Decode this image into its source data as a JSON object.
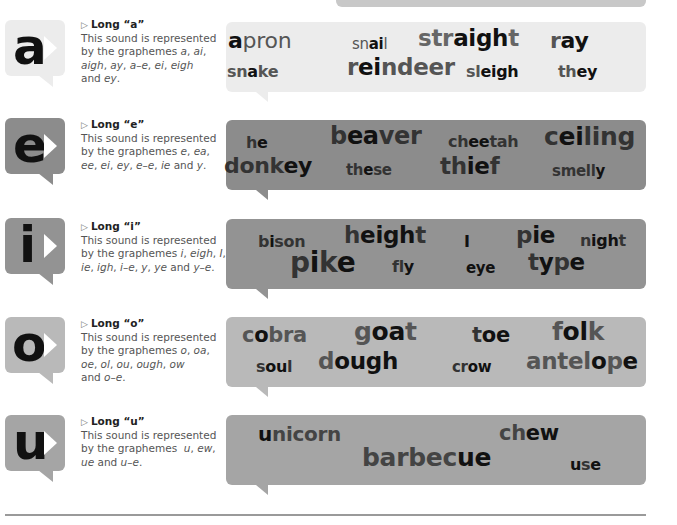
{
  "colors": {
    "a_bubble": "#ececec",
    "e_bubble": "#8c8c8c",
    "i_bubble": "#939393",
    "o_bubble": "#b9b9b9",
    "u_bubble": "#a5a5a5",
    "word_dim": "#555555",
    "word_strong": "#111111"
  },
  "sections": [
    {
      "letter": "a",
      "title": "Long “a”",
      "desc_line1": "This sound is represented",
      "desc_line2": "by the graphemes a, ai,",
      "desc_line3": "aigh, ay, a–e, ei, eigh",
      "desc_line4": "and ey.",
      "words": [
        "apron",
        "snail",
        "straight",
        "ray",
        "snake",
        "reindeer",
        "sleigh",
        "they"
      ]
    },
    {
      "letter": "e",
      "title": "Long “e”",
      "desc_line1": "This sound is represented",
      "desc_line2": "by the graphemes e, ea,",
      "desc_line3": "ee, ei, ey, e–e, ie and y.",
      "words": [
        "he",
        "beaver",
        "cheetah",
        "ceiling",
        "donkey",
        "these",
        "thief",
        "smelly"
      ]
    },
    {
      "letter": "i",
      "title": "Long “i”",
      "desc_line1": "This sound is represented",
      "desc_line2": "by the graphemes i, eigh, I,",
      "desc_line3": "ie, igh, i–e, y, ye and y–e.",
      "words": [
        "bison",
        "height",
        "I",
        "pie",
        "night",
        "pike",
        "fly",
        "eye",
        "type"
      ]
    },
    {
      "letter": "o",
      "title": "Long “o”",
      "desc_line1": "This sound is represented",
      "desc_line2": "by the graphemes o, oa,",
      "desc_line3": "oe, ol, ou, ough, ow",
      "desc_line4": "and o–e.",
      "words": [
        "cobra",
        "goat",
        "toe",
        "folk",
        "soul",
        "dough",
        "crow",
        "antelope"
      ]
    },
    {
      "letter": "u",
      "title": "Long “u”",
      "desc_line1": "This sound is represented",
      "desc_line2": "by the graphemes  u, ew,",
      "desc_line3": "ue and u–e.",
      "words": [
        "unicorn",
        "chew",
        "barbecue",
        "use"
      ]
    }
  ],
  "word_parts": {
    "a": [
      {
        "pre": "",
        "hi": "a",
        "post": "pron"
      },
      {
        "pre": "sn",
        "hi": "ai",
        "post": "l"
      },
      {
        "pre": "str",
        "hi": "aigh",
        "post": "t"
      },
      {
        "pre": "r",
        "hi": "ay",
        "post": ""
      },
      {
        "pre": "sn",
        "hi": "a",
        "post": "k",
        "post2": "e"
      },
      {
        "pre": "r",
        "hi": "ei",
        "post": "ndeer"
      },
      {
        "pre": "sl",
        "hi": "eigh",
        "post": ""
      },
      {
        "pre": "th",
        "hi": "ey",
        "post": ""
      }
    ],
    "e": [
      {
        "pre": "h",
        "hi": "e",
        "post": ""
      },
      {
        "pre": "b",
        "hi": "ea",
        "post": "ver"
      },
      {
        "pre": "ch",
        "hi": "ee",
        "post": "tah"
      },
      {
        "pre": "c",
        "hi": "ei",
        "post": "ling"
      },
      {
        "pre": "donk",
        "hi": "ey",
        "post": ""
      },
      {
        "pre": "th",
        "hi": "e",
        "post": "s",
        "post2": "e"
      },
      {
        "pre": "th",
        "hi": "ie",
        "post": "f"
      },
      {
        "pre": "smell",
        "hi": "y",
        "post": ""
      }
    ],
    "i": [
      {
        "pre": "b",
        "hi": "i",
        "post": "son"
      },
      {
        "pre": "h",
        "hi": "eigh",
        "post": "t"
      },
      {
        "pre": "",
        "hi": "I",
        "post": ""
      },
      {
        "pre": "p",
        "hi": "ie",
        "post": ""
      },
      {
        "pre": "n",
        "hi": "igh",
        "post": "t"
      },
      {
        "pre": "p",
        "hi": "i",
        "post": "k",
        "post2": "e"
      },
      {
        "pre": "fl",
        "hi": "y",
        "post": ""
      },
      {
        "pre": "",
        "hi": "eye",
        "post": ""
      },
      {
        "pre": "t",
        "hi": "y",
        "post": "p",
        "post2": "e"
      }
    ],
    "o": [
      {
        "pre": "c",
        "hi": "o",
        "post": "bra"
      },
      {
        "pre": "g",
        "hi": "oa",
        "post": "t"
      },
      {
        "pre": "t",
        "hi": "oe",
        "post": ""
      },
      {
        "pre": "f",
        "hi": "ol",
        "post": "k"
      },
      {
        "pre": "s",
        "hi": "ou",
        "post": "l"
      },
      {
        "pre": "d",
        "hi": "ough",
        "post": ""
      },
      {
        "pre": "cr",
        "hi": "ow",
        "post": ""
      },
      {
        "pre": "antel",
        "hi": "o",
        "post": "p",
        "post2": "e"
      }
    ],
    "u": [
      {
        "pre": "",
        "hi": "u",
        "post": "nicorn"
      },
      {
        "pre": "ch",
        "hi": "ew",
        "post": ""
      },
      {
        "pre": "barbec",
        "hi": "ue",
        "post": ""
      },
      {
        "pre": "",
        "hi": "u",
        "post": "s",
        "post2": "e"
      }
    ]
  }
}
